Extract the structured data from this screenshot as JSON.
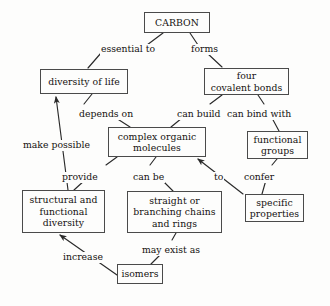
{
  "diagram": {
    "type": "concept-map",
    "stroke_color": "#4a4a4a",
    "text_color": "#14110f",
    "background_color": "#fdfdfc",
    "nodes": [
      {
        "id": "carbon",
        "label": "CARBON",
        "x": 144,
        "y": 12,
        "w": 66,
        "h": 21
      },
      {
        "id": "diversity",
        "label": "diversity of life",
        "x": 40,
        "y": 69,
        "w": 88,
        "h": 25
      },
      {
        "id": "bonds",
        "label": "four\ncovalent bonds",
        "x": 204,
        "y": 68,
        "w": 85,
        "h": 27
      },
      {
        "id": "molecules",
        "label": "complex organic\nmolecules",
        "x": 108,
        "y": 127,
        "w": 98,
        "h": 30
      },
      {
        "id": "functional",
        "label": "functional\ngroups",
        "x": 247,
        "y": 131,
        "w": 61,
        "h": 28
      },
      {
        "id": "structural",
        "label": "structural and\nfunctional\ndiversity",
        "x": 22,
        "y": 190,
        "w": 83,
        "h": 43
      },
      {
        "id": "chains",
        "label": "straight or\nbranching chains\nand rings",
        "x": 127,
        "y": 191,
        "w": 95,
        "h": 42
      },
      {
        "id": "properties",
        "label": "specific\nproperties",
        "x": 245,
        "y": 194,
        "w": 59,
        "h": 28
      },
      {
        "id": "isomers",
        "label": "isomers",
        "x": 117,
        "y": 264,
        "w": 46,
        "h": 20
      }
    ],
    "edges": [
      {
        "id": "e1",
        "from": "carbon",
        "to": "diversity",
        "label": "essential to",
        "label_x": 100,
        "label_y": 44,
        "arrow": false,
        "path": "M 163 33 L 147 45 M 101 53 L 88 68"
      },
      {
        "id": "e2",
        "from": "carbon",
        "to": "bonds",
        "label": "forms",
        "label_x": 190,
        "label_y": 44,
        "arrow": false,
        "path": "M 190 33 L 198 45 M 207 53 L 222 67"
      },
      {
        "id": "e3",
        "from": "diversity",
        "to": "molecules",
        "label": "depends on",
        "label_x": 78,
        "label_y": 109,
        "arrow": false,
        "path": "M 92 94 L 84 104 M 116 118 L 130 127"
      },
      {
        "id": "e4",
        "from": "bonds",
        "to": "molecules",
        "label": "can build",
        "label_x": 176,
        "label_y": 109,
        "arrow": false,
        "path": "M 222 95 L 210 104 M 182 118 L 171 127"
      },
      {
        "id": "e5",
        "from": "bonds",
        "to": "functional",
        "label": "can bind with",
        "label_x": 226,
        "label_y": 109,
        "arrow": false,
        "path": "M 258 95 L 264 104 M 272 118 L 279 131"
      },
      {
        "id": "e6",
        "from": "structural",
        "to": "diversity",
        "label": "make possible",
        "label_x": 22,
        "label_y": 140,
        "arrow": true,
        "path": "M 68 190 L 56 97"
      },
      {
        "id": "e7",
        "from": "molecules",
        "to": "structural",
        "label": "provide",
        "label_x": 61,
        "label_y": 172,
        "arrow": false,
        "path": "M 117 157 L 106 165 M 85 180 L 74 190"
      },
      {
        "id": "e8",
        "from": "molecules",
        "to": "chains",
        "label": "can be",
        "label_x": 132,
        "label_y": 172,
        "arrow": false,
        "path": "M 156 157 L 150 165 M 162 180 L 173 191"
      },
      {
        "id": "e9",
        "from": "properties",
        "to": "molecules",
        "label": "to",
        "label_x": 213,
        "label_y": 172,
        "arrow": true,
        "path": "M 243 194 L 198 159"
      },
      {
        "id": "e10",
        "from": "functional",
        "to": "properties",
        "label": "confer",
        "label_x": 243,
        "label_y": 172,
        "arrow": false,
        "path": "M 277 159 L 272 165 M 266 180 L 262 194"
      },
      {
        "id": "e11",
        "from": "chains",
        "to": "isomers",
        "label": "may exist as",
        "label_x": 141,
        "label_y": 245,
        "arrow": false,
        "path": "M 176 233 L 172 240 M 160 255 L 151 264"
      },
      {
        "id": "e12",
        "from": "isomers",
        "to": "structural",
        "label": "increase",
        "label_x": 62,
        "label_y": 252,
        "arrow": true,
        "path": "M 117 275 L 60 235"
      }
    ]
  }
}
